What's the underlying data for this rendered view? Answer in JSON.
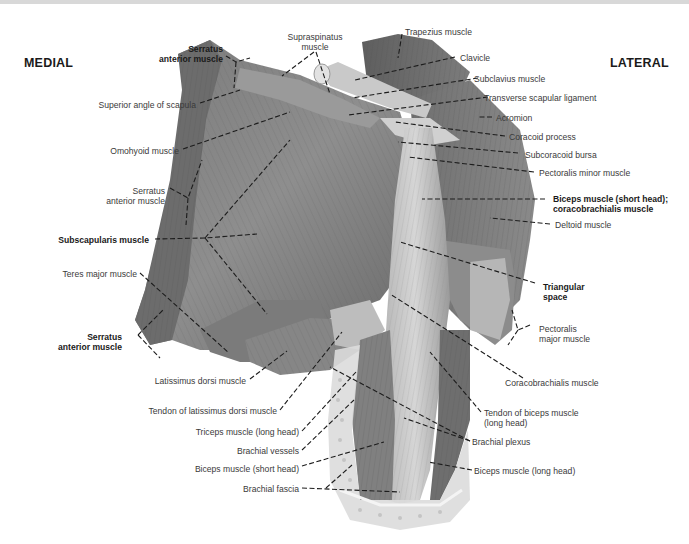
{
  "figure": {
    "orientation": {
      "left": "MEDIAL",
      "right": "LATERAL"
    },
    "labels": {
      "trapezius": "Trapezius muscle",
      "supraspinatus": "Supraspinatus\nmuscle",
      "serratus_top": "Serratus\nanterior muscle",
      "clavicle": "Clavicle",
      "subclavius": "Subclavius muscle",
      "superior_angle": "Superior angle of scapula",
      "transverse_ligament": "Transverse scapular ligament",
      "acromion": "Acromion",
      "coracoid": "Coracoid process",
      "omohyoid": "Omohyoid muscle",
      "subcoracoid_bursa": "Subcoracoid bursa",
      "pectoralis_minor": "Pectoralis minor muscle",
      "serratus_mid": "Serratus\nanterior muscle",
      "biceps_short_coraco": "Biceps muscle (short head);\ncoracobrachialis muscle",
      "deltoid": "Deltoid muscle",
      "subscapularis": "Subscapularis muscle",
      "teres_major": "Teres major muscle",
      "triangular_space": "Triangular\nspace",
      "serratus_bottom": "Serratus\nanterior muscle",
      "pectoralis_major": "Pectoralis\nmajor muscle",
      "latissimus": "Latissimus dorsi muscle",
      "coracobrachialis": "Coracobrachialis muscle",
      "tendon_latissimus": "Tendon of latissimus dorsi muscle",
      "tendon_biceps": "Tendon of biceps muscle\n(long head)",
      "triceps": "Triceps muscle (long head)",
      "brachial_plexus": "Brachial plexus",
      "brachial_vessels": "Brachial vessels",
      "biceps_short": "Biceps muscle (short head)",
      "biceps_long": "Biceps muscle (long head)",
      "brachial_fascia": "Brachial fascia"
    }
  }
}
